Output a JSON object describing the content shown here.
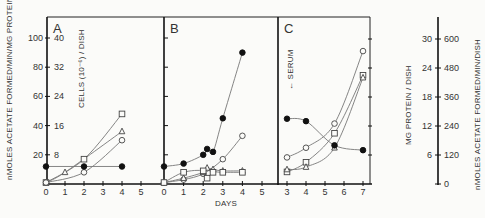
{
  "chart_data": [
    {
      "type": "line",
      "panel": "A",
      "xlabel": "",
      "x_ticks": [
        "0",
        "1",
        "2",
        "3",
        "4",
        "5"
      ],
      "xlim": [
        0,
        5
      ],
      "ylabel": "nMOLES ACETATE FORMED/MIN/MG PROTEIN",
      "ylim": [
        0,
        110
      ],
      "y_ticks": [
        "20",
        "40",
        "60",
        "80",
        "100"
      ],
      "y2label": "CELLS (10^-6)/DISH",
      "y2_ticks": [
        "8",
        "16",
        "24",
        "32",
        "40"
      ],
      "series": [
        {
          "name": "open-square",
          "marker": "square-open",
          "x": [
            0,
            2,
            4
          ],
          "y": [
            1,
            17,
            48
          ]
        },
        {
          "name": "open-triangle",
          "marker": "triangle-open",
          "x": [
            0,
            1,
            4
          ],
          "y": [
            1,
            8,
            36
          ]
        },
        {
          "name": "open-circle",
          "marker": "circle-open",
          "x": [
            0,
            2,
            4
          ],
          "y": [
            1,
            8,
            30
          ]
        },
        {
          "name": "filled-circle",
          "marker": "circle-filled",
          "x": [
            0,
            2,
            4
          ],
          "y": [
            12,
            12,
            12
          ]
        }
      ]
    },
    {
      "type": "line",
      "panel": "B",
      "xlabel": "DAYS",
      "x_ticks": [
        "0",
        "1",
        "2",
        "3",
        "4",
        "5"
      ],
      "xlim": [
        0,
        5
      ],
      "ylim": [
        0,
        110
      ],
      "series": [
        {
          "name": "filled-circle",
          "marker": "circle-filled",
          "x": [
            0,
            1,
            2,
            2.2,
            2.5,
            3,
            4
          ],
          "y": [
            12,
            14,
            20,
            24,
            22,
            45,
            90
          ]
        },
        {
          "name": "open-circle",
          "marker": "circle-open",
          "x": [
            0,
            1,
            2,
            3,
            4
          ],
          "y": [
            1,
            3,
            7,
            17,
            33
          ]
        },
        {
          "name": "open-triangle",
          "marker": "triangle-open",
          "x": [
            0,
            1,
            2,
            2.2,
            2.5,
            3,
            4
          ],
          "y": [
            1,
            4,
            8,
            11,
            10,
            9,
            9
          ]
        },
        {
          "name": "open-square",
          "marker": "square-open",
          "x": [
            0,
            1,
            2,
            2.2,
            2.5,
            3,
            4
          ],
          "y": [
            1,
            8,
            9,
            4,
            8,
            8,
            8
          ]
        }
      ]
    },
    {
      "type": "line",
      "panel": "C",
      "xlabel": "",
      "x_ticks": [
        "3",
        "4",
        "5",
        "6",
        "7"
      ],
      "xlim": [
        2.6,
        7.4
      ],
      "ylim": [
        0,
        33
      ],
      "annotation": "SERUM",
      "y_right_label": "MG PROTEIN / DISH",
      "y_right_ticks": [
        "6",
        "12",
        "18",
        "24",
        "30"
      ],
      "y_right2_label": "nMOLES ACETATE FORMED/MIN/DISH",
      "y_right2_ticks": [
        "0",
        "120",
        "240",
        "360",
        "480",
        "600"
      ],
      "series": [
        {
          "name": "open-circle",
          "marker": "circle-open",
          "x": [
            3,
            4,
            5.5,
            7
          ],
          "y": [
            5.5,
            7.5,
            12.5,
            27.5
          ]
        },
        {
          "name": "open-square",
          "marker": "square-open",
          "x": [
            3,
            4,
            5.5,
            7
          ],
          "y": [
            2.5,
            4.5,
            10.5,
            22.5
          ]
        },
        {
          "name": "open-triangle",
          "marker": "triangle-open",
          "x": [
            3,
            4,
            5.5,
            7
          ],
          "y": [
            3.0,
            3.5,
            7.5,
            22.0
          ]
        },
        {
          "name": "filled-circle",
          "marker": "circle-filled",
          "x": [
            3,
            4,
            5.5,
            7
          ],
          "y": [
            13.5,
            13.0,
            8.0,
            7.0
          ]
        }
      ]
    }
  ],
  "labels": {
    "panel_a": "A",
    "panel_b": "B",
    "panel_c": "C",
    "days": "DAYS",
    "serum": "← SERUM",
    "left_axis": "nMOLES ACETATE FORMED/MIN/MG PROTEIN",
    "cells_axis": "CELLS (10⁻⁶) / DISH",
    "protein_axis": "MG PROTEIN / DISH",
    "right_axis": "nMOLES ACETATE FORMED/MIN/DISH"
  }
}
